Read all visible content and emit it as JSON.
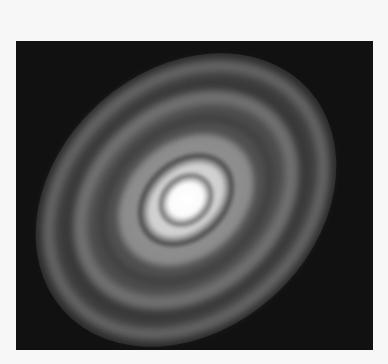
{
  "image": {
    "subject": "protoplanetary disk with concentric rings",
    "colors": {
      "background": "#f7f7f7",
      "frame": "#111111",
      "core": "#ffffff"
    }
  }
}
